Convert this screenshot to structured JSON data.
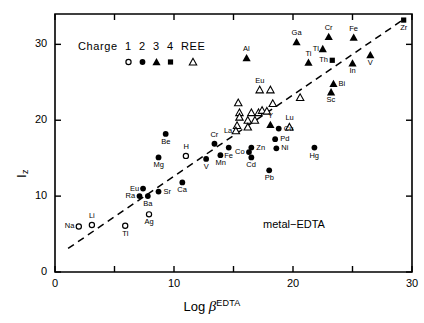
{
  "chart_data": {
    "type": "scatter",
    "title": "",
    "annotation": "metal−EDTA",
    "xlabel": "Log β",
    "xlabel_sup": "EDTA",
    "ylabel": "I",
    "ylabel_sub": "z",
    "xlim": [
      0,
      30
    ],
    "ylim": [
      0,
      34
    ],
    "xticks": [
      0,
      5,
      10,
      15,
      20,
      25,
      30
    ],
    "xtick_labels": [
      "0",
      "",
      "10",
      "",
      "20",
      "",
      "30"
    ],
    "yticks": [
      0,
      10,
      20,
      30
    ],
    "ytick_labels": [
      "0",
      "10",
      "20",
      "30"
    ],
    "grid": false,
    "trendline": {
      "x0": 1.1,
      "y0": 3.1,
      "x1": 29.4,
      "y1": 33.4,
      "style": "dashed"
    },
    "legend": {
      "title": "Charge",
      "position": "top-left-inside",
      "entries": [
        {
          "label": "1",
          "marker": "open-circle"
        },
        {
          "label": "2",
          "marker": "filled-circle"
        },
        {
          "label": "3",
          "marker": "filled-triangle"
        },
        {
          "label": "4",
          "marker": "filled-square"
        },
        {
          "label": "REE",
          "marker": "open-triangle"
        }
      ]
    },
    "series": [
      {
        "name": "Charge 1",
        "marker": "open-circle",
        "points": [
          {
            "label": "Na",
            "x": 2.0,
            "y": 6.0,
            "lpos": "left"
          },
          {
            "label": "Li",
            "x": 3.1,
            "y": 6.2,
            "lpos": "top"
          },
          {
            "label": "Tl",
            "x": 5.9,
            "y": 6.1,
            "lpos": "bottom"
          },
          {
            "label": "Ag",
            "x": 7.9,
            "y": 7.6,
            "lpos": "bottom"
          },
          {
            "label": "H",
            "x": 11.0,
            "y": 15.3,
            "lpos": "top"
          }
        ]
      },
      {
        "name": "Charge 2",
        "marker": "filled-circle",
        "points": [
          {
            "label": "Be",
            "x": 9.3,
            "y": 18.2,
            "lpos": "bottom"
          },
          {
            "label": "Mg",
            "x": 8.7,
            "y": 15.1,
            "lpos": "bottom"
          },
          {
            "label": "Eu",
            "x": 7.4,
            "y": 11.0,
            "lpos": "left"
          },
          {
            "label": "Sr",
            "x": 8.7,
            "y": 10.6,
            "lpos": "right"
          },
          {
            "label": "Ra",
            "x": 7.1,
            "y": 10.0,
            "lpos": "left"
          },
          {
            "label": "Ba",
            "x": 7.8,
            "y": 10.0,
            "lpos": "bottom"
          },
          {
            "label": "Ca",
            "x": 10.7,
            "y": 11.8,
            "lpos": "bottom"
          },
          {
            "label": "V",
            "x": 12.7,
            "y": 14.9,
            "lpos": "bottom"
          },
          {
            "label": "Mn",
            "x": 13.9,
            "y": 15.4,
            "lpos": "bottom"
          },
          {
            "label": "Cr",
            "x": 13.4,
            "y": 16.9,
            "lpos": "top"
          },
          {
            "label": "Fe",
            "x": 14.6,
            "y": 16.4,
            "lpos": "bottom"
          },
          {
            "label": "Co",
            "x": 16.3,
            "y": 15.8,
            "lpos": "left"
          },
          {
            "label": "Cd",
            "x": 16.5,
            "y": 15.1,
            "lpos": "bottom"
          },
          {
            "label": "Zn",
            "x": 16.5,
            "y": 16.4,
            "lpos": "right"
          },
          {
            "label": "Ni",
            "x": 18.6,
            "y": 16.3,
            "lpos": "right"
          },
          {
            "label": "Pd",
            "x": 18.5,
            "y": 17.5,
            "lpos": "right"
          },
          {
            "label": "Cu",
            "x": 18.8,
            "y": 18.9,
            "lpos": "right"
          },
          {
            "label": "Hg",
            "x": 21.8,
            "y": 16.4,
            "lpos": "bottom"
          },
          {
            "label": "Pb",
            "x": 18.0,
            "y": 13.4,
            "lpos": "bottom"
          }
        ]
      },
      {
        "name": "Charge 3",
        "marker": "filled-triangle",
        "points": [
          {
            "label": "Al",
            "x": 16.1,
            "y": 28.2,
            "lpos": "top"
          },
          {
            "label": "Ga",
            "x": 20.3,
            "y": 30.3,
            "lpos": "top"
          },
          {
            "label": "Cr",
            "x": 23.0,
            "y": 31.0,
            "lpos": "top"
          },
          {
            "label": "Fe",
            "x": 25.1,
            "y": 30.9,
            "lpos": "top"
          },
          {
            "label": "Tl",
            "x": 22.5,
            "y": 29.4,
            "lpos": "left"
          },
          {
            "label": "Ti",
            "x": 21.3,
            "y": 27.6,
            "lpos": "top"
          },
          {
            "label": "In",
            "x": 25.0,
            "y": 27.5,
            "lpos": "bottom"
          },
          {
            "label": "V",
            "x": 26.5,
            "y": 28.6,
            "lpos": "bottom"
          },
          {
            "label": "Bi",
            "x": 23.4,
            "y": 24.8,
            "lpos": "right"
          },
          {
            "label": "Sc",
            "x": 23.2,
            "y": 23.7,
            "lpos": "bottom"
          },
          {
            "label": "Y",
            "x": 18.1,
            "y": 19.4,
            "lpos": "top"
          }
        ]
      },
      {
        "name": "Charge 4",
        "marker": "filled-square",
        "points": [
          {
            "label": "Th",
            "x": 23.3,
            "y": 27.9,
            "lpos": "left"
          },
          {
            "label": "Zr",
            "x": 29.3,
            "y": 33.2,
            "lpos": "bottom"
          }
        ]
      },
      {
        "name": "REE",
        "marker": "open-triangle",
        "points": [
          {
            "label": "Eu",
            "x": 17.2,
            "y": 24.0,
            "lpos": "top"
          },
          {
            "label": "",
            "x": 18.1,
            "y": 24.0,
            "lpos": "none"
          },
          {
            "label": "",
            "x": 15.4,
            "y": 22.3,
            "lpos": "none"
          },
          {
            "label": "",
            "x": 15.5,
            "y": 21.0,
            "lpos": "none"
          },
          {
            "label": "",
            "x": 15.5,
            "y": 20.4,
            "lpos": "none"
          },
          {
            "label": "",
            "x": 16.5,
            "y": 21.0,
            "lpos": "none"
          },
          {
            "label": "",
            "x": 17.1,
            "y": 21.0,
            "lpos": "none"
          },
          {
            "label": "",
            "x": 17.4,
            "y": 21.3,
            "lpos": "none"
          },
          {
            "label": "",
            "x": 17.8,
            "y": 21.2,
            "lpos": "none"
          },
          {
            "label": "",
            "x": 18.3,
            "y": 22.2,
            "lpos": "none"
          },
          {
            "label": "",
            "x": 16.2,
            "y": 20.0,
            "lpos": "none"
          },
          {
            "label": "",
            "x": 16.8,
            "y": 20.0,
            "lpos": "none"
          },
          {
            "label": "",
            "x": 15.3,
            "y": 19.3,
            "lpos": "none"
          },
          {
            "label": "",
            "x": 16.2,
            "y": 19.1,
            "lpos": "none"
          },
          {
            "label": "La",
            "x": 15.2,
            "y": 18.6,
            "lpos": "left"
          },
          {
            "label": "Lu",
            "x": 19.7,
            "y": 19.1,
            "lpos": "top"
          },
          {
            "label": "",
            "x": 20.6,
            "y": 23.0,
            "lpos": "none"
          }
        ]
      }
    ]
  }
}
